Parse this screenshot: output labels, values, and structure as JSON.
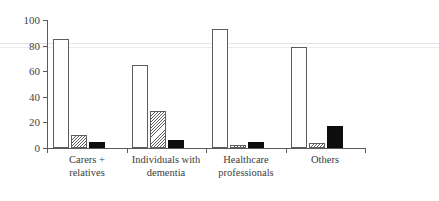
{
  "figure": {
    "title_ghost": "",
    "background": "#ffffff",
    "axis_color": "#5a5a5a"
  },
  "chart_data": {
    "type": "bar",
    "title": "",
    "subtitle": "",
    "xlabel": "",
    "ylabel": "",
    "ylim": [
      0,
      100
    ],
    "yticks": [
      0,
      20,
      40,
      60,
      80,
      100
    ],
    "ytick_labels": [
      "0",
      "20",
      "40",
      "60",
      "80",
      "100"
    ],
    "grid": false,
    "legend": false,
    "legend_position": "none",
    "categories": [
      "Carers +\nrelatives",
      "Individuals with\ndementia",
      "Healthcare\nprofessionals",
      "Others"
    ],
    "category_lines": [
      [
        "Carers +",
        "relatives"
      ],
      [
        "Individuals with",
        "dementia"
      ],
      [
        "Healthcare",
        "professionals"
      ],
      [
        "Others"
      ]
    ],
    "series": [
      {
        "name": "series-1",
        "style": "white",
        "color": "#ffffff",
        "edge": "#5d5d5d",
        "values": [
          85,
          65,
          93,
          79
        ]
      },
      {
        "name": "series-2",
        "style": "hatched",
        "color": "#ffffff",
        "edge": "#5d5d5d",
        "values": [
          10,
          29,
          2,
          4
        ]
      },
      {
        "name": "series-3",
        "style": "black",
        "color": "#0d0d0d",
        "edge": "#0d0d0d",
        "values": [
          5,
          6,
          5,
          17
        ]
      }
    ]
  }
}
